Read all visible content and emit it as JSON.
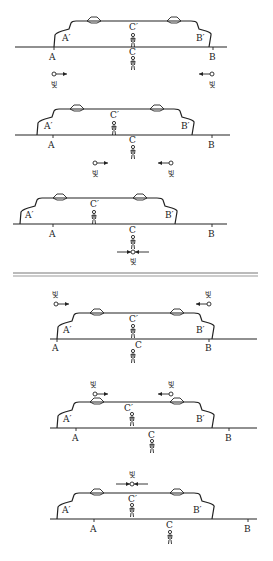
{
  "diagram": {
    "light_label": "빛",
    "top_section": {
      "panels": [
        {
          "id": "p1",
          "labels": {
            "A": "A",
            "B": "B",
            "C": "C",
            "A_prime": "A′",
            "B_prime": "B′",
            "C_prime": "C′"
          },
          "light": [
            "→ from A (right-moving)",
            "← from B (left-moving)"
          ]
        },
        {
          "id": "p2",
          "labels": {
            "A": "A",
            "B": "B",
            "C": "C",
            "A_prime": "A′",
            "B_prime": "B′",
            "C_prime": "C′"
          },
          "light": [
            "→ approaching C from left",
            "← approaching C from right"
          ]
        },
        {
          "id": "p3",
          "labels": {
            "A": "A",
            "B": "B",
            "C": "C",
            "A_prime": "A′",
            "B_prime": "B′",
            "C_prime": "C′"
          },
          "light": [
            "→ ← both arrive at C simultaneously"
          ]
        }
      ]
    },
    "bottom_section": {
      "panels": [
        {
          "id": "p4",
          "labels": {
            "A": "A",
            "B": "B",
            "C": "C",
            "A_prime": "A′",
            "B_prime": "B′",
            "C_prime": "C′"
          },
          "light": [
            "→ from A′ (right-moving)",
            "← from B′ (left-moving)"
          ]
        },
        {
          "id": "p5",
          "labels": {
            "A": "A",
            "B": "B",
            "C": "C",
            "A_prime": "A′",
            "B_prime": "B′",
            "C_prime": "C′"
          },
          "light": [
            "→ approaching C′ from left",
            "← approaching C′ from right"
          ]
        },
        {
          "id": "p6",
          "labels": {
            "A": "A",
            "B": "B",
            "C": "C",
            "A_prime": "A′",
            "B_prime": "B′",
            "C_prime": "C′"
          },
          "light": [
            "→ ← both arrive at C′ simultaneously"
          ]
        }
      ]
    }
  }
}
